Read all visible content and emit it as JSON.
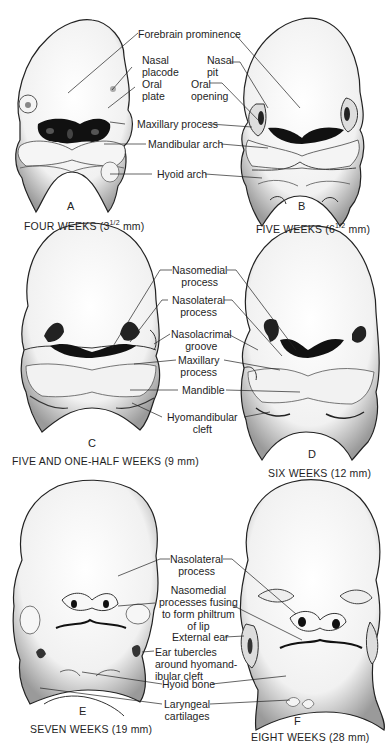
{
  "figure": {
    "panels": [
      {
        "letter": "A",
        "caption": "FOUR WEEKS (3½ mm)",
        "labels": [
          "Forebrain prominence",
          "Nasal placode",
          "Oral plate",
          "Maxillary process",
          "Mandibular arch",
          "Hyoid arch"
        ]
      },
      {
        "letter": "B",
        "caption": "FIVE WEEKS (6½ mm)",
        "labels": [
          "Nasal pit",
          "Oral opening"
        ]
      },
      {
        "letter": "C",
        "caption": "FIVE AND ONE-HALF WEEKS (9 mm)",
        "labels": [
          "Nasomedial process",
          "Nasolateral process",
          "Nasolacrimal groove",
          "Maxillary process",
          "Mandible",
          "Hyomandibular cleft"
        ]
      },
      {
        "letter": "D",
        "caption": "SIX WEEKS (12 mm)",
        "labels": []
      },
      {
        "letter": "E",
        "caption": "SEVEN WEEKS (19 mm)",
        "labels": [
          "Nasolateral process",
          "Nasomedial processes fusing to form philtrum of lip",
          "External ear",
          "Ear tubercles around hyomandibular cleft",
          "Hyoid bone",
          "Laryngeal cartilages"
        ]
      },
      {
        "letter": "F",
        "caption": "EIGHT WEEKS (28 mm)",
        "labels": []
      }
    ],
    "text": {
      "forebrain": "Forebrain prominence",
      "nasal_placode_1": "Nasal",
      "nasal_placode_2": "placode",
      "oral_plate_1": "Oral",
      "oral_plate_2": "plate",
      "nasal_pit_1": "Nasal",
      "nasal_pit_2": "pit",
      "oral_opening_1": "Oral",
      "oral_opening_2": "opening",
      "maxillary_A": "Maxillary process",
      "mandibular_arch": "Mandibular arch",
      "hyoid_arch": "Hyoid arch",
      "nasomedial_1": "Nasomedial",
      "nasomedial_2": "process",
      "nasolateral_1": "Nasolateral",
      "nasolateral_2": "process",
      "nasolacrimal_1": "Nasolacrimal",
      "nasolacrimal_2": "groove",
      "maxillary_C_1": "Maxillary",
      "maxillary_C_2": "process",
      "mandible": "Mandible",
      "hyomandibular_1": "Hyomandibular",
      "hyomandibular_2": "cleft",
      "nasolateral_E_1": "Nasolateral",
      "nasolateral_E_2": "process",
      "philtrum_1": "Nasomedial",
      "philtrum_2": "processes fusing",
      "philtrum_3": "to form philtrum",
      "philtrum_4": "of lip",
      "external_ear": "External ear",
      "ear_tub_1": "Ear tubercles",
      "ear_tub_2": "around hyomand-",
      "ear_tub_3": "ibular cleft",
      "hyoid_bone": "Hyoid bone",
      "laryngeal_1": "Laryngeal",
      "laryngeal_2": "cartilages"
    },
    "letters": {
      "A": "A",
      "B": "B",
      "C": "C",
      "D": "D",
      "E": "E",
      "F": "F"
    },
    "captions": {
      "A": "FOUR WEEKS (3",
      "A_frac": "1/2",
      "A_tail": " mm)",
      "B": "FIVE WEEKS (6",
      "B_frac": "1/2",
      "B_tail": " mm)",
      "C": "FIVE AND ONE-HALF WEEKS (9 mm)",
      "D": "SIX WEEKS (12 mm)",
      "E": "SEVEN WEEKS (19 mm)",
      "F": "EIGHT WEEKS (28 mm)"
    },
    "colors": {
      "ink": "#1a1a1a",
      "shade": "#8a8a8a",
      "paper": "#ffffff",
      "dark": "#0d0d0d"
    }
  }
}
